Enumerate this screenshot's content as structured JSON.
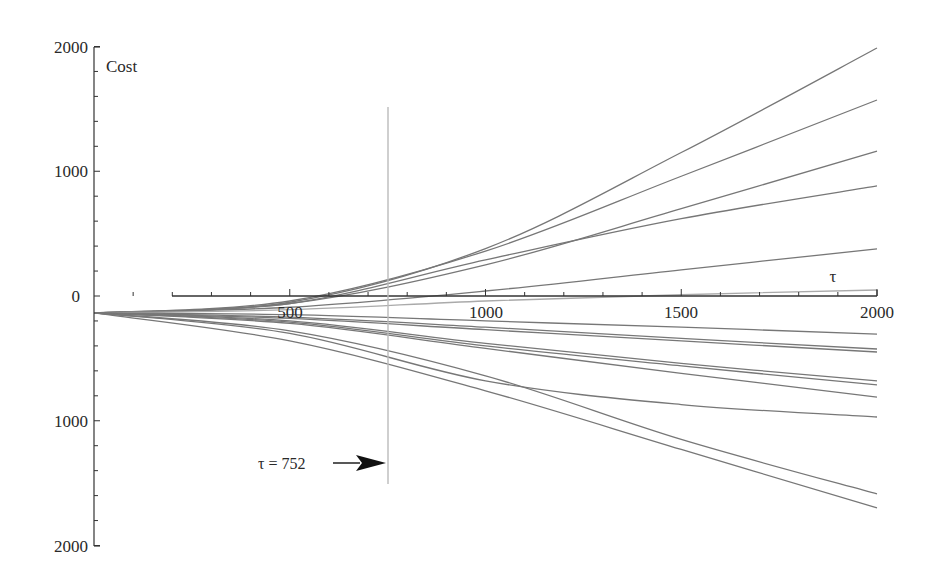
{
  "chart_data": {
    "type": "line",
    "title": "",
    "xlabel": "τ",
    "ylabel": "Cost",
    "xlim": [
      0,
      2000
    ],
    "ylim": [
      -2000,
      2000
    ],
    "x_ticks": [
      500,
      1000,
      1500,
      2000
    ],
    "x_tick_labels": [
      "500",
      "1000",
      "1500",
      "2000"
    ],
    "y_ticks": [
      2000,
      1000,
      0,
      -1000,
      -2000
    ],
    "y_tick_labels": [
      "2000",
      "1000",
      "0",
      "1000",
      "2000"
    ],
    "grid": false,
    "legend": null,
    "annotation": {
      "label": "τ = 752",
      "x": 752,
      "marker": "vertical line with arrow",
      "y_range": [
        -1500,
        1520
      ]
    },
    "x": [
      0,
      500,
      1000,
      1500,
      2000
    ],
    "series": [
      {
        "name": "s1",
        "values": [
          -136,
          -50,
          380,
          1150,
          1988
        ]
      },
      {
        "name": "s2",
        "values": [
          -136,
          -40,
          360,
          960,
          1571
        ]
      },
      {
        "name": "s3",
        "values": [
          -136,
          -60,
          250,
          700,
          1162
        ]
      },
      {
        "name": "s4",
        "values": [
          -136,
          -60,
          290,
          620,
          882
        ]
      },
      {
        "name": "s5",
        "values": [
          -136,
          -90,
          40,
          210,
          377
        ]
      },
      {
        "name": "s6",
        "values": [
          -136,
          -110,
          -40,
          10,
          48
        ]
      },
      {
        "name": "s7",
        "values": [
          -136,
          -150,
          -200,
          -250,
          -305
        ]
      },
      {
        "name": "s8",
        "values": [
          -136,
          -170,
          -250,
          -340,
          -425
        ]
      },
      {
        "name": "s9",
        "values": [
          -136,
          -180,
          -270,
          -360,
          -449
        ]
      },
      {
        "name": "s10",
        "values": [
          -136,
          -200,
          -380,
          -540,
          -681
        ]
      },
      {
        "name": "s11",
        "values": [
          -136,
          -210,
          -400,
          -560,
          -713
        ]
      },
      {
        "name": "s12",
        "values": [
          -136,
          -220,
          -420,
          -620,
          -810
        ]
      },
      {
        "name": "s13",
        "values": [
          -136,
          -300,
          -680,
          -870,
          -970
        ]
      },
      {
        "name": "s14",
        "values": [
          -136,
          -280,
          -640,
          -1150,
          -1587
        ]
      },
      {
        "name": "s15",
        "values": [
          -136,
          -360,
          -760,
          -1230,
          -1699
        ]
      }
    ],
    "colors": {
      "line": "#777777",
      "axis": "#333333",
      "marker_line": "#bbbbbb",
      "arrow": "#111111"
    }
  },
  "labels": {
    "y_axis_title": "Cost",
    "x_axis_title": "τ",
    "annotation": "τ = 752",
    "x_tick_500": "500",
    "x_tick_1000": "1000",
    "x_tick_1500": "1500",
    "x_tick_2000": "2000",
    "y_tick_2000": "2000",
    "y_tick_1000": "1000",
    "y_tick_0": "0",
    "y_tick_m1000": "1000",
    "y_tick_m2000": "2000"
  }
}
